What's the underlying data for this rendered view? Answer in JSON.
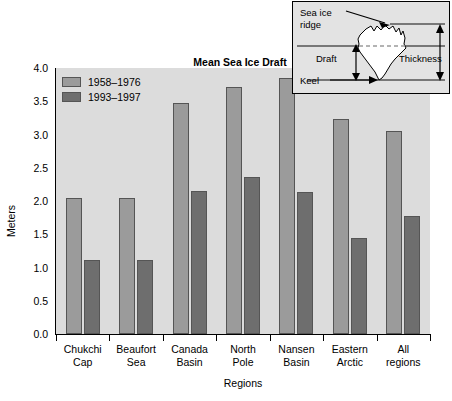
{
  "chart_data": {
    "type": "bar",
    "title": "Mean Sea Ice Draft",
    "xlabel": "Regions",
    "ylabel": "Meters",
    "ylim": [
      0.0,
      4.0
    ],
    "ytick_labels": [
      "0.0",
      "0.5",
      "1.0",
      "1.5",
      "2.0",
      "2.5",
      "3.0",
      "3.5",
      "4.0"
    ],
    "ytick_values": [
      0.0,
      0.5,
      1.0,
      1.5,
      2.0,
      2.5,
      3.0,
      3.5,
      4.0
    ],
    "grid": false,
    "legend_position": "top-left inside plot",
    "categories": [
      "Chukchi Cap",
      "Beaufort Sea",
      "Canada Basin",
      "North Pole",
      "Nansen Basin",
      "Eastern Arctic",
      "All regions"
    ],
    "category_lines": [
      [
        "Chukchi",
        "Cap"
      ],
      [
        "Beaufort",
        "Sea"
      ],
      [
        "Canada",
        "Basin"
      ],
      [
        "North",
        "Pole"
      ],
      [
        "Nansen",
        "Basin"
      ],
      [
        "Eastern",
        "Arctic"
      ],
      [
        "All",
        "regions"
      ]
    ],
    "series": [
      {
        "name": "1958–1976",
        "color": "#9b9b9b",
        "values": [
          2.05,
          2.04,
          3.47,
          3.72,
          3.85,
          3.23,
          3.05
        ]
      },
      {
        "name": "1993–1997",
        "color": "#6e6e6e",
        "values": [
          1.11,
          1.11,
          2.15,
          2.36,
          2.14,
          1.45,
          1.77
        ]
      }
    ]
  },
  "inset": {
    "labels": {
      "sea_ice_ridge_line1": "Sea ice",
      "sea_ice_ridge_line2": "ridge",
      "draft": "Draft",
      "thickness": "Thickness",
      "keel": "Keel"
    }
  },
  "colors": {
    "plot_background": "#dcdcdc",
    "page_background": "#ffffff",
    "series_1958_1976": "#9b9b9b",
    "series_1993_1997": "#6e6e6e",
    "axis": "#000000",
    "inset_background": "#e3e3e3"
  }
}
